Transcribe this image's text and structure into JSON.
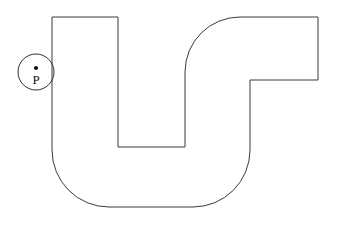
{
  "figure": {
    "background_color": "#ffffff",
    "stroke_color": "#3b3b3b",
    "label_color": "#141414",
    "type": "geometry-diagram"
  },
  "shape": {
    "name": "u-shaped-track",
    "path": "M 52 17 L 118 17 L 118 147 L 185 147 L 185 72 A 55 55 0 0 1 240 17 L 318 17 L 318 80 L 250 80 L 250 150 A 57 57 0 0 1 193 207 L 109 207 A 57 57 0 0 1 52 150 Z",
    "vertices": [
      {
        "x": 52,
        "y": 17
      },
      {
        "x": 118,
        "y": 17
      },
      {
        "x": 118,
        "y": 147
      },
      {
        "x": 185,
        "y": 147
      },
      {
        "x": 185,
        "y": 72
      },
      {
        "x": 240,
        "y": 17
      },
      {
        "x": 318,
        "y": 17
      },
      {
        "x": 318,
        "y": 80
      },
      {
        "x": 250,
        "y": 80
      },
      {
        "x": 250,
        "y": 150
      },
      {
        "x": 193,
        "y": 207
      },
      {
        "x": 109,
        "y": 207
      },
      {
        "x": 52,
        "y": 150
      }
    ]
  },
  "marker": {
    "name": "point-p",
    "label": "P",
    "circle": {
      "cx": 36,
      "cy": 72,
      "r": 18
    },
    "dot": {
      "cx": 36,
      "cy": 68,
      "r": 2.1
    },
    "label_position": {
      "x": 36,
      "y": 84
    }
  }
}
